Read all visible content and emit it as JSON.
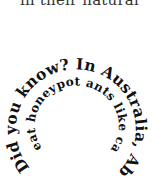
{
  "top_text": {
    "partial_line": "in their natural"
  },
  "spiral": {
    "outer_text": "Did you know? In Australia, Aboriginals",
    "inner_text": "eat honeypot ants like candy.",
    "full_text": "Did you know? In Australia, Aboriginals eat honeypot ants like candy.",
    "text_color": "#111111"
  }
}
